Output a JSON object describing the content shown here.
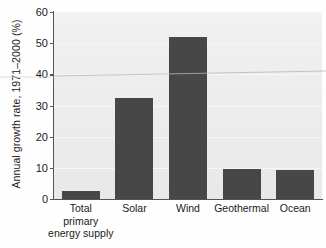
{
  "chart_data": {
    "type": "bar",
    "title": "",
    "xlabel": "",
    "ylabel": "Annual growth rate, 1971–2000 (%)",
    "categories": [
      "Total\nprimary\nenergy supply",
      "Solar",
      "Wind",
      "Geothermal",
      "Ocean"
    ],
    "values": [
      2.5,
      32.5,
      52.0,
      9.5,
      9.2
    ],
    "ylim": [
      0,
      60
    ],
    "yticks": [
      0,
      10,
      20,
      30,
      40,
      50,
      60
    ],
    "ytick_labels": [
      "0",
      "10",
      "20",
      "30",
      "40",
      "50",
      "60"
    ],
    "grid": true,
    "legend": null,
    "bar_color": "#474747",
    "plot_background": "#eeeeee"
  },
  "axes": {
    "y_axis_title": "Annual growth rate, 1971–2000 (%)",
    "y_tick_labels": [
      "60",
      "50",
      "40",
      "30",
      "20",
      "10",
      "0"
    ],
    "x_tick_labels": [
      "Total\nprimary\nenergy supply",
      "Solar",
      "Wind",
      "Geothermal",
      "Ocean"
    ]
  },
  "colors": {
    "bar": "#474747",
    "axis": "#555555",
    "plot_bg": "#eeeeee",
    "grid": "#f7f7f7",
    "text": "#1a1a1a",
    "page_bg": "#ffffff"
  }
}
